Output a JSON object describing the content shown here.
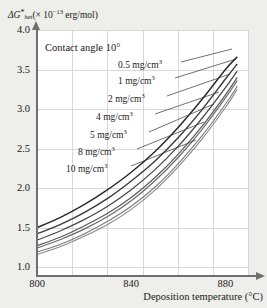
{
  "chart_data": {
    "type": "line",
    "title": "",
    "annotation": "Contact angle 10°",
    "xlabel": "Deposition temperature (°C)",
    "ylabel_parts": {
      "delta": "Δ",
      "G": "G",
      "star": "*",
      "sub": "het",
      "rest": "(× 10",
      "exp": "−13",
      "units": " erg/mol)"
    },
    "ylabel_full": "ΔG*het (× 10⁻¹³ erg/mol)",
    "xlim": [
      800,
      890
    ],
    "ylim": [
      0.9,
      4.0
    ],
    "xticks": [
      "800",
      "840",
      "880"
    ],
    "xtick_values": [
      800,
      840,
      880
    ],
    "yticks": [
      "1.0",
      "1.5",
      "2.0",
      "2.5",
      "3.0",
      "3.5",
      "4.0"
    ],
    "ytick_values": [
      1.0,
      1.5,
      2.0,
      2.5,
      3.0,
      3.5,
      4.0
    ],
    "grid": true,
    "legend_position": "inline-labels",
    "x": [
      800,
      810,
      820,
      830,
      840,
      850,
      860,
      870,
      880,
      885
    ],
    "series": [
      {
        "name": "0.5 mg/cm³",
        "label": "0.5 mg/cm",
        "sup": "3",
        "color": "#2b2b2b",
        "width": 1.5,
        "values": [
          1.5,
          1.63,
          1.79,
          1.98,
          2.2,
          2.46,
          2.77,
          3.12,
          3.5,
          3.66
        ]
      },
      {
        "name": "1 mg/cm³",
        "label": "1 mg/cm",
        "sup": "3",
        "color": "#3a3a3a",
        "width": 1.4,
        "values": [
          1.42,
          1.54,
          1.69,
          1.87,
          2.09,
          2.34,
          2.64,
          2.99,
          3.38,
          3.57
        ]
      },
      {
        "name": "2 mg/cm³",
        "label": "2 mg/cm",
        "sup": "3",
        "color": "#4a4a4a",
        "width": 1.3,
        "values": [
          1.34,
          1.46,
          1.6,
          1.77,
          1.98,
          2.23,
          2.53,
          2.88,
          3.27,
          3.48
        ]
      },
      {
        "name": "4 mg/cm³",
        "label": "4 mg/cm",
        "sup": "3",
        "color": "#5a5a5a",
        "width": 1.2,
        "values": [
          1.27,
          1.38,
          1.52,
          1.68,
          1.88,
          2.13,
          2.43,
          2.78,
          3.18,
          3.4
        ]
      },
      {
        "name": "5 mg/cm³",
        "label": "5 mg/cm",
        "sup": "3",
        "color": "#6a6a6a",
        "width": 1.2,
        "values": [
          1.24,
          1.35,
          1.48,
          1.64,
          1.84,
          2.09,
          2.39,
          2.74,
          3.14,
          3.36
        ]
      },
      {
        "name": "8 mg/cm³",
        "label": "8 mg/cm",
        "sup": "3",
        "color": "#7c7c7c",
        "width": 1.1,
        "values": [
          1.19,
          1.29,
          1.42,
          1.58,
          1.77,
          2.01,
          2.31,
          2.66,
          3.06,
          3.29
        ]
      },
      {
        "name": "10 mg/cm³",
        "label": "10 mg/cm",
        "sup": "3",
        "color": "#8a8a8a",
        "width": 1.1,
        "values": [
          1.16,
          1.26,
          1.39,
          1.54,
          1.73,
          1.97,
          2.27,
          2.62,
          3.02,
          3.25
        ]
      }
    ],
    "curve_label_positions": [
      {
        "left": 118,
        "top": 58
      },
      {
        "left": 118,
        "top": 74
      },
      {
        "left": 108,
        "top": 92
      },
      {
        "left": 96,
        "top": 110
      },
      {
        "left": 90,
        "top": 128
      },
      {
        "left": 78,
        "top": 145
      },
      {
        "left": 66,
        "top": 162
      }
    ],
    "leaders": [
      {
        "x1": 181,
        "y1": 62,
        "x2": 232,
        "y2": 49
      },
      {
        "x1": 175,
        "y1": 78,
        "x2": 236,
        "y2": 59
      },
      {
        "x1": 167,
        "y1": 96,
        "x2": 230,
        "y2": 74
      },
      {
        "x1": 155,
        "y1": 114,
        "x2": 219,
        "y2": 92
      },
      {
        "x1": 149,
        "y1": 132,
        "x2": 214,
        "y2": 104
      },
      {
        "x1": 137,
        "y1": 149,
        "x2": 204,
        "y2": 122
      },
      {
        "x1": 131,
        "y1": 166,
        "x2": 196,
        "y2": 140
      }
    ]
  }
}
